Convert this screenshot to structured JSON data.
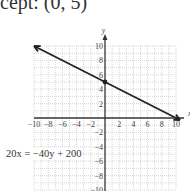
{
  "caption": "cept: (0, 5)",
  "equation": "20x = −40y + 200",
  "chart_data": {
    "type": "line",
    "title": "",
    "xlabel": "x",
    "ylabel": "y",
    "xlim": [
      -10,
      10
    ],
    "ylim": [
      -10,
      10
    ],
    "grid": true,
    "x_ticks": [
      "−10",
      "−8",
      "−6",
      "−4",
      "−2",
      "2",
      "4",
      "6",
      "8",
      "10"
    ],
    "y_ticks": [
      "10",
      "8",
      "6",
      "4",
      "2",
      "−2",
      "−4",
      "−6",
      "−8",
      "−10"
    ],
    "series": [
      {
        "name": "20x = -40y + 200",
        "x": [
          -10,
          0,
          10
        ],
        "y": [
          10,
          5,
          0
        ],
        "arrows": "both",
        "marked_point": [
          0,
          5
        ]
      }
    ],
    "annotations": [
      "20x = −40y + 200",
      "y-intercept (0, 5)"
    ]
  },
  "colors": {
    "line": "#222222",
    "grid": "#bbbbbb",
    "axis": "#333333"
  }
}
